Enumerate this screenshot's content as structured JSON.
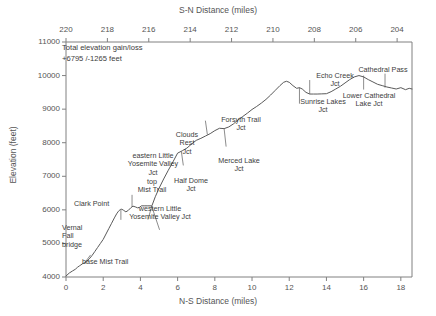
{
  "chart_data": {
    "type": "line",
    "title": "",
    "xlabel": "N-S Distance (miles)",
    "ylabel": "Elevation (feet)",
    "top_xlabel": "S-N Distance (miles)",
    "xlim": [
      0,
      18.6
    ],
    "ylim": [
      4000,
      11000
    ],
    "grid": false,
    "legend": "none",
    "xticks": [
      0,
      2,
      4,
      6,
      8,
      10,
      12,
      14,
      16,
      18
    ],
    "xtick_labels": [
      "0",
      "2",
      "4",
      "6",
      "8",
      "10",
      "12",
      "14",
      "16",
      "18"
    ],
    "top_xticks": [
      220,
      218,
      216,
      214,
      212,
      210,
      208,
      206,
      204
    ],
    "top_xtick_labels": [
      "220",
      "218",
      "216",
      "214",
      "212",
      "210",
      "208",
      "206",
      "204"
    ],
    "yticks": [
      4000,
      5000,
      6000,
      7000,
      8000,
      9000,
      10000,
      11000
    ],
    "ytick_labels": [
      "4000",
      "5000",
      "6000",
      "7000",
      "8000",
      "9000",
      "10000",
      "11000"
    ],
    "series_name": "elevation profile",
    "x": [
      0.0,
      0.18,
      0.35,
      0.5,
      0.62,
      0.72,
      0.8,
      0.9,
      1.0,
      1.12,
      1.25,
      1.4,
      1.55,
      1.7,
      1.85,
      2.0,
      2.15,
      2.3,
      2.45,
      2.6,
      2.72,
      2.82,
      2.92,
      3.0,
      3.1,
      3.22,
      3.35,
      3.48,
      3.6,
      3.72,
      3.85,
      3.95,
      4.05,
      4.2,
      4.4,
      4.6,
      4.62,
      4.8,
      5.0,
      5.25,
      5.5,
      5.75,
      6.0,
      6.25,
      6.5,
      6.75,
      7.0,
      7.25,
      7.5,
      7.75,
      8.0,
      8.25,
      8.5,
      8.75,
      9.0,
      9.25,
      9.5,
      9.75,
      10.0,
      10.25,
      10.5,
      10.75,
      11.0,
      11.25,
      11.5,
      11.7,
      11.85,
      12.0,
      12.2,
      12.4,
      12.55,
      12.7,
      12.9,
      13.1,
      13.3,
      13.5,
      13.75,
      14.0,
      14.25,
      14.5,
      14.75,
      15.0,
      15.25,
      15.5,
      15.75,
      16.0,
      16.25,
      16.5,
      16.75,
      17.0,
      17.25,
      17.5,
      17.75,
      18.0,
      18.25,
      18.45,
      18.6
    ],
    "y": [
      4030,
      4120,
      4180,
      4230,
      4290,
      4330,
      4360,
      4400,
      4420,
      4470,
      4540,
      4640,
      4760,
      4880,
      5000,
      5120,
      5280,
      5440,
      5600,
      5760,
      5880,
      5960,
      6010,
      6020,
      5985,
      5940,
      5985,
      6060,
      6110,
      6090,
      6060,
      6075,
      6120,
      6120,
      6120,
      6120,
      6125,
      6390,
      6640,
      6920,
      7180,
      7430,
      7690,
      7760,
      7840,
      7960,
      8070,
      8130,
      8200,
      8270,
      8360,
      8430,
      8420,
      8470,
      8560,
      8680,
      8780,
      8880,
      8990,
      9080,
      9180,
      9290,
      9420,
      9560,
      9700,
      9800,
      9830,
      9800,
      9700,
      9620,
      9640,
      9600,
      9500,
      9450,
      9450,
      9450,
      9455,
      9460,
      9520,
      9600,
      9680,
      9780,
      9880,
      9960,
      10000,
      9960,
      9880,
      9810,
      9740,
      9700,
      9660,
      9630,
      9600,
      9640,
      9580,
      9620,
      9600
    ],
    "annotations": {
      "note_title": "Total elevation gain/loss",
      "note_value": "+6795 /-1265 feet"
    },
    "points_of_interest": [
      {
        "label": "Vernal\nFall\nbridge",
        "x": 0.8,
        "y": 4360
      },
      {
        "label": "base Mist Trail",
        "x": 1.0,
        "y": 4420
      },
      {
        "label": "Clark Point",
        "x": 2.0,
        "y": 5120
      },
      {
        "label": "top\nMist Trail",
        "x": 2.95,
        "y": 6000
      },
      {
        "label": "western Little\nYosemite Valley Jct",
        "x": 3.55,
        "y": 6090
      },
      {
        "label": "eastern Little\nYosemite Valley\nJct",
        "x": 4.6,
        "y": 6120
      },
      {
        "label": "Half Dome\nJct",
        "x": 4.62,
        "y": 6125
      },
      {
        "label": "Clouds\nRest\nJct",
        "x": 6.2,
        "y": 7740
      },
      {
        "label": "Merced Lake\nJct",
        "x": 7.6,
        "y": 8240
      },
      {
        "label": "Forsyth Trail\nJct",
        "x": 8.5,
        "y": 8420
      },
      {
        "label": "Sunrise Lakes\nJct",
        "x": 13.1,
        "y": 9450
      },
      {
        "label": "Echo Creek\nJct",
        "x": 12.55,
        "y": 9640
      },
      {
        "label": "Cathedral Pass",
        "x": 16.0,
        "y": 10000
      },
      {
        "label": "Lower Cathedral\nLake Jct",
        "x": 17.15,
        "y": 9640
      }
    ]
  },
  "colors": {
    "axis": "#808080",
    "line": "#5a5a5a",
    "text": "#444444",
    "background": "#ffffff"
  }
}
